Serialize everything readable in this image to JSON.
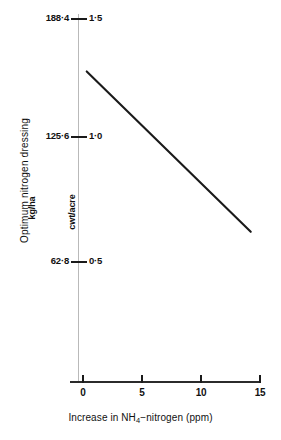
{
  "chart_data": {
    "type": "line",
    "title": "",
    "xlabel": "Increase in NH4-nitrogen (ppm)",
    "xlabel_parts": {
      "before": "Increase in NH",
      "sub": "4",
      "after": "−nitrogen (ppm)"
    },
    "ylabel": "Optimum nitrogen dressing",
    "y_unit_left": "kg/ha",
    "y_unit_right": "cwt/acre",
    "grid": false,
    "legend": "none",
    "xlim": [
      -1,
      15.8
    ],
    "ylim_left": [
      0,
      188.4
    ],
    "ylim_right": [
      0,
      1.5
    ],
    "x_ticks": [
      {
        "value": 0,
        "label": "0"
      },
      {
        "value": 5,
        "label": "5"
      },
      {
        "value": 10,
        "label": "10"
      },
      {
        "value": 15,
        "label": "15"
      }
    ],
    "y_ticks": [
      {
        "value_right": 1.5,
        "label_left": "188·4",
        "label_right": "1·5"
      },
      {
        "value_right": 1.0,
        "label_left": "125·6",
        "label_right": "1·0"
      },
      {
        "value_right": 0.5,
        "label_left": "62·8",
        "label_right": "0·5"
      }
    ],
    "series": [
      {
        "name": "Optimum nitrogen dressing",
        "color": "#1a1a1a",
        "x": [
          0.4,
          14.3
        ],
        "y_right": [
          1.28,
          0.62
        ],
        "y_left": [
          160.8,
          77.9
        ],
        "points": [
          {
            "x": 0.4,
            "y_cwt_acre": 1.28,
            "y_kg_ha": 160.8
          },
          {
            "x": 14.3,
            "y_cwt_acre": 0.62,
            "y_kg_ha": 77.9
          }
        ]
      }
    ]
  }
}
